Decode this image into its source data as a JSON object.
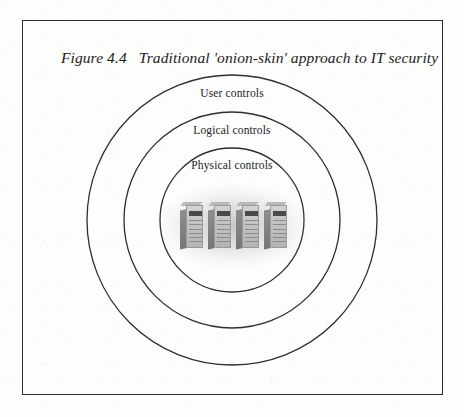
{
  "figure": {
    "caption_number": "Figure 4.4",
    "caption_text": "Traditional 'onion-skin' approach to IT security"
  },
  "diagram": {
    "type": "concentric-rings",
    "center": {
      "x": 232,
      "y": 220
    },
    "rings": [
      {
        "name": "user-controls",
        "label": "User controls",
        "radius": 145,
        "label_y": 93
      },
      {
        "name": "logical-controls",
        "label": "Logical controls",
        "radius": 108,
        "label_y": 130
      },
      {
        "name": "physical-controls",
        "label": "Physical controls",
        "radius": 72,
        "label_y": 165
      }
    ],
    "center_graphic": {
      "name": "server-cluster",
      "unit_count": 4,
      "description": "four grayscale tower servers"
    },
    "colors": {
      "page_background": "#fdfdfc",
      "frame_border": "#2b2b2b",
      "ring_stroke": "#2e2e2e",
      "text": "#23211f",
      "server_body": "#c3c3c3",
      "server_side": "#7d7d7d",
      "glow": "#9a9a9a"
    }
  }
}
